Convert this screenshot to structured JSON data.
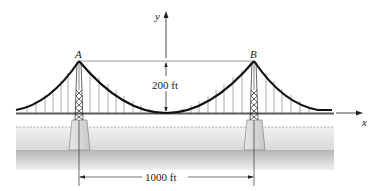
{
  "diagram": {
    "type": "suspension-bridge",
    "labels": {
      "point_a": "A",
      "point_b": "B",
      "y_axis": "y",
      "x_axis": "x",
      "sag_dimension": "200 ft",
      "span_dimension": "1000 ft"
    },
    "geometry": {
      "span_ft": 1000,
      "sag_ft": 200,
      "tower_a_x": 79,
      "tower_b_x": 254,
      "tower_top_y": 61,
      "deck_y": 113,
      "origin_x": 166
    },
    "colors": {
      "cable": "#111111",
      "hanger": "#777777",
      "deck": "#555555",
      "water_light": "#e4e4e4",
      "water_dark": "#bcbcbc",
      "pier": "#d8d8d8",
      "dimension_line": "#444444"
    }
  }
}
